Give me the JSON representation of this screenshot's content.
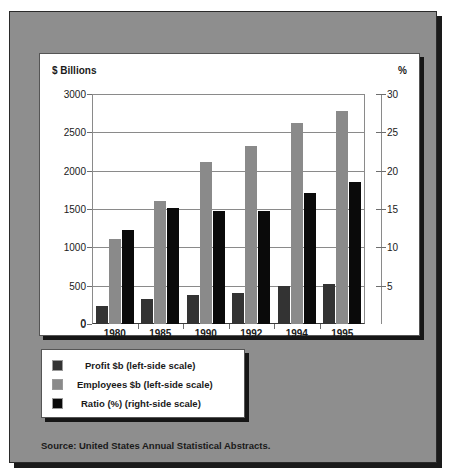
{
  "chart_data": {
    "type": "bar",
    "title": "",
    "categories": [
      "1980",
      "1985",
      "1990",
      "1992",
      "1994",
      "1995"
    ],
    "series": [
      {
        "name": "Profit $b (left-side scale)",
        "axis": "left",
        "color": "#333333",
        "values": [
          230,
          330,
          380,
          400,
          500,
          520
        ]
      },
      {
        "name": "Employees $b (left-side scale)",
        "axis": "left",
        "color": "#8a8a8a",
        "values": [
          1110,
          1610,
          2110,
          2320,
          2620,
          2780
        ]
      },
      {
        "name": "Ratio (%) (right-side scale)",
        "axis": "right",
        "color": "#0a0a0a",
        "values": [
          12.2,
          15.1,
          14.8,
          14.8,
          17.1,
          18.5
        ]
      }
    ],
    "xlabel": "",
    "ylabel": "$ Billions",
    "y2label": "%",
    "ylim": [
      0,
      3000
    ],
    "y2lim": [
      0,
      30
    ],
    "yticks": [
      "3000",
      "2500",
      "2000",
      "1500",
      "1000",
      "500",
      "0"
    ],
    "y2ticks": [
      "30",
      "25",
      "20",
      "15",
      "10",
      "5"
    ],
    "grid": true,
    "legend_position": "below-plot"
  },
  "axes": {
    "left_unit_label": "$ Billions",
    "right_unit_label": "%",
    "zero_label": "0"
  },
  "legend": {
    "items": [
      {
        "label": "Profit $b (left-side scale)",
        "color": "#333333"
      },
      {
        "label": "Employees $b (left-side scale)",
        "color": "#8a8a8a"
      },
      {
        "label": "Ratio (%) (right-side scale)",
        "color": "#0a0a0a"
      }
    ]
  },
  "source": {
    "text": "Source: United States Annual Statistical Abstracts."
  },
  "colors": {
    "background": "#8e8e8e",
    "panel": "#ffffff",
    "grid": "#8a8a8a",
    "shadow": "#161616"
  }
}
